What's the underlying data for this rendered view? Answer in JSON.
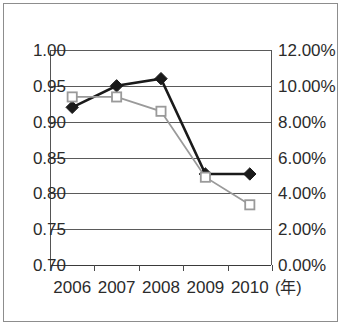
{
  "chart_data": {
    "type": "line",
    "title": "",
    "xlabel": "(年)",
    "categories": [
      "2006",
      "2007",
      "2008",
      "2009",
      "2010"
    ],
    "grid": true,
    "legend": "none",
    "axes": {
      "left": {
        "label": "",
        "min": 0.7,
        "max": 1.0,
        "step": 0.05,
        "ticks": [
          "0.70",
          "0.75",
          "0.80",
          "0.85",
          "0.90",
          "0.95",
          "1.00"
        ],
        "tick_values": [
          0.7,
          0.75,
          0.8,
          0.85,
          0.9,
          0.95,
          1.0
        ]
      },
      "right": {
        "label": "",
        "min": 0.0,
        "max": 12.0,
        "step": 2.0,
        "ticks": [
          "0.00%",
          "2.00%",
          "4.00%",
          "6.00%",
          "8.00%",
          "10.00%",
          "12.00%"
        ],
        "tick_values": [
          0.0,
          2.0,
          4.0,
          6.0,
          8.0,
          10.0,
          12.0
        ]
      }
    },
    "series": [
      {
        "name": "diamond-series",
        "axis": "left",
        "marker": "diamond-filled",
        "color": "#1a1a1a",
        "values": [
          0.92,
          0.95,
          0.96,
          0.827,
          0.827
        ]
      },
      {
        "name": "square-series",
        "axis": "right",
        "marker": "square-open",
        "color": "#9a9a9a",
        "values": [
          9.38,
          9.38,
          8.58,
          4.9,
          3.36
        ]
      }
    ]
  },
  "colors": {
    "frame": "#8d8d8d",
    "grid": "#5a5a5a",
    "axis": "#3a3a3a",
    "series_dark": "#1a1a1a",
    "series_light": "#9a9a9a",
    "text": "#2b2b2b",
    "background": "#ffffff"
  }
}
